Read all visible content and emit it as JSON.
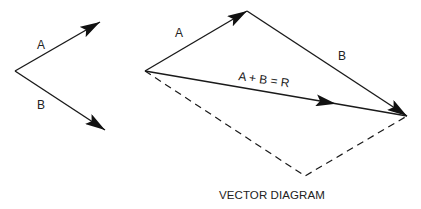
{
  "diagram": {
    "title": "VECTOR DIAGRAM",
    "left_figure": {
      "vector_a_label": "A",
      "vector_b_label": "B"
    },
    "right_figure": {
      "vector_a_label": "A",
      "vector_b_label": "B",
      "resultant_label": "A + B = R"
    },
    "colors": {
      "line": "#1a1a1a",
      "background": "#ffffff"
    }
  }
}
